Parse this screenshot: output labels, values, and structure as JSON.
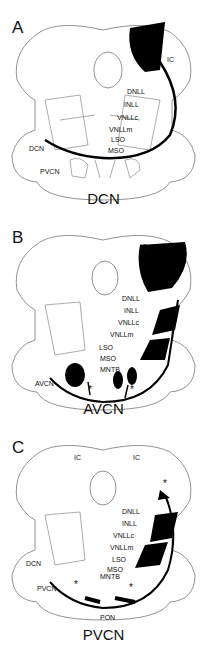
{
  "panels": [
    {
      "letter": "A",
      "title": "DCN",
      "labels": {
        "IC": "IC",
        "DNLL": "DNLL",
        "INLL": "INLL",
        "VNLLc": "VNLLc",
        "VNLLm": "VNLLm",
        "LSO": "LSO",
        "MSO": "MSO",
        "DCN": "DCN",
        "PVCN": "PVCN"
      }
    },
    {
      "letter": "B",
      "title": "AVCN",
      "labels": {
        "IC": "IC",
        "DNLL": "DNLL",
        "INLL": "INLL",
        "VNLLc": "VNLLc",
        "VNLLm": "VNLLm",
        "LSO": "LSO",
        "MSO": "MSO",
        "MNTB": "MNTB",
        "AVCN": "AVCN",
        "star1": "*",
        "star2": "*"
      }
    },
    {
      "letter": "C",
      "title": "PVCN",
      "labels": {
        "IC_left": "IC",
        "IC_right": "IC",
        "star_top": "*",
        "DNLL": "DNLL",
        "INLL": "INLL",
        "VNLLc": "VNLLc",
        "VNLLm": "VNLLm",
        "LSO": "LSO",
        "MSO": "MSO",
        "MNTB": "MNTB",
        "DCN": "DCN",
        "PVCN": "PVCN",
        "PON": "PON",
        "star1": "*",
        "star2": "*"
      }
    }
  ]
}
